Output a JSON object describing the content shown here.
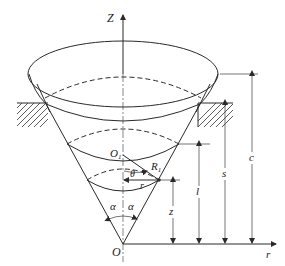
{
  "figure": {
    "labels": {
      "z_axis": "Z",
      "r_axis": "r",
      "origin": "O",
      "center_o1": "O",
      "center_o1_sub": "1",
      "radius_r1": "R",
      "radius_r1_sub": "1",
      "theta": "θ",
      "radius_r": "r",
      "alpha_left": "α",
      "alpha_right": "α",
      "dim_z": "z",
      "dim_l": "l",
      "dim_s": "s",
      "dim_c": "c"
    },
    "colors": {
      "line": "#2a2a2a",
      "background": "#ffffff"
    }
  }
}
